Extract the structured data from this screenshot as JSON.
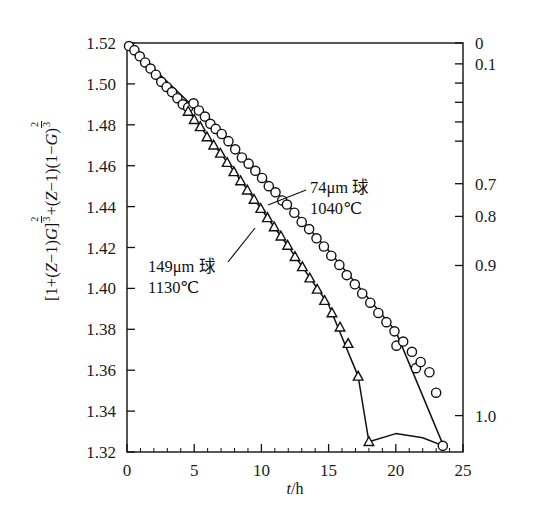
{
  "figure": {
    "background": "#ffffff",
    "ink": "#111111"
  },
  "axes": {
    "x": {
      "label_italic": "t",
      "label_rest": "/h",
      "label": "t/h",
      "min": 0,
      "max": 25,
      "ticks": [
        0,
        5,
        10,
        15,
        20,
        25
      ],
      "tick_labels": [
        "0",
        "5",
        "10",
        "15",
        "20",
        "25"
      ],
      "minor_step": 1
    },
    "y_left": {
      "label": "[1+(Z−1)G]^(2/3)+(Z−1)(1−G)^(2/3)",
      "label_parts": {
        "p1": "[1+(",
        "zi1": "Z",
        "p2": "−1)",
        "gi": "G",
        "p3": "]",
        "exp_num": "2",
        "exp_den": "3",
        "p4": "+(",
        "zi2": "Z",
        "p5": "−1)(1−",
        "gi2": "G",
        "p6": ")",
        "exp2_num": "2",
        "exp2_den": "3"
      },
      "min": 1.32,
      "max": 1.52,
      "ticks": [
        1.52,
        1.5,
        1.48,
        1.46,
        1.44,
        1.42,
        1.4,
        1.38,
        1.36,
        1.34,
        1.32
      ],
      "tick_labels": [
        "1.52",
        "1.50",
        "1.48",
        "1.46",
        "1.44",
        "1.42",
        "1.40",
        "1.38",
        "1.36",
        "1.34",
        "1.32"
      ]
    },
    "y_right": {
      "label": "",
      "tick_labels": [
        "0",
        "0.1",
        "",
        "",
        "",
        "",
        "0.7",
        "0.8",
        "0.9",
        "1.0"
      ],
      "labeled_ticks": [
        {
          "text": "0",
          "y_frac": 0.0
        },
        {
          "text": "0.1",
          "y_frac": 0.051
        },
        {
          "text": "",
          "y_frac": 0.098
        },
        {
          "text": "",
          "y_frac": 0.145
        },
        {
          "text": "",
          "y_frac": 0.193
        },
        {
          "text": "",
          "y_frac": 0.24
        },
        {
          "text": "0.7",
          "y_frac": 0.344
        },
        {
          "text": "0.8",
          "y_frac": 0.424
        },
        {
          "text": "0.9",
          "y_frac": 0.544
        },
        {
          "text": "1.0",
          "y_frac": 0.911
        }
      ]
    }
  },
  "annotations": [
    {
      "name": "series-74um-label",
      "line1": "74μm 球",
      "line2": "1040℃",
      "x": 310,
      "y": 188
    },
    {
      "name": "series-149um-label",
      "line1": "149μm 球",
      "line2": "1130℃",
      "x": 148,
      "y": 268
    }
  ],
  "chart_data": {
    "type": "scatter",
    "title": "",
    "xlabel": "t/h",
    "ylabel": "[1+(Z−1)G]^(2/3)+(Z−1)(1−G)^(2/3)",
    "xlim": [
      0,
      25
    ],
    "ylim": [
      1.32,
      1.52
    ],
    "grid": false,
    "legend": "inline annotations",
    "series": [
      {
        "name": "74μm 球 1040℃",
        "marker": "open-circle",
        "has_fit_line": true,
        "points": [
          {
            "x": 0.15,
            "y": 1.5185
          },
          {
            "x": 0.55,
            "y": 1.5165
          },
          {
            "x": 0.95,
            "y": 1.5135
          },
          {
            "x": 1.35,
            "y": 1.5105
          },
          {
            "x": 1.75,
            "y": 1.5075
          },
          {
            "x": 2.15,
            "y": 1.5045
          },
          {
            "x": 2.55,
            "y": 1.501
          },
          {
            "x": 2.95,
            "y": 1.4985
          },
          {
            "x": 3.35,
            "y": 1.496
          },
          {
            "x": 3.75,
            "y": 1.493
          },
          {
            "x": 4.15,
            "y": 1.49
          },
          {
            "x": 4.55,
            "y": 1.4885
          },
          {
            "x": 4.95,
            "y": 1.4905
          },
          {
            "x": 5.35,
            "y": 1.487
          },
          {
            "x": 5.8,
            "y": 1.484
          },
          {
            "x": 6.2,
            "y": 1.4805
          },
          {
            "x": 6.6,
            "y": 1.478
          },
          {
            "x": 7.05,
            "y": 1.4755
          },
          {
            "x": 7.55,
            "y": 1.472
          },
          {
            "x": 8.05,
            "y": 1.468
          },
          {
            "x": 8.55,
            "y": 1.464
          },
          {
            "x": 9.05,
            "y": 1.461
          },
          {
            "x": 9.55,
            "y": 1.4575
          },
          {
            "x": 10.05,
            "y": 1.454
          },
          {
            "x": 10.55,
            "y": 1.45
          },
          {
            "x": 11.05,
            "y": 1.447
          },
          {
            "x": 11.55,
            "y": 1.443
          },
          {
            "x": 11.9,
            "y": 1.441
          },
          {
            "x": 12.45,
            "y": 1.437
          },
          {
            "x": 13.0,
            "y": 1.4325
          },
          {
            "x": 13.55,
            "y": 1.429
          },
          {
            "x": 14.1,
            "y": 1.4245
          },
          {
            "x": 14.65,
            "y": 1.4205
          },
          {
            "x": 15.2,
            "y": 1.416
          },
          {
            "x": 15.8,
            "y": 1.4115
          },
          {
            "x": 16.35,
            "y": 1.4065
          },
          {
            "x": 16.95,
            "y": 1.402
          },
          {
            "x": 17.5,
            "y": 1.3975
          },
          {
            "x": 18.1,
            "y": 1.393
          },
          {
            "x": 18.7,
            "y": 1.388
          },
          {
            "x": 19.3,
            "y": 1.3835
          },
          {
            "x": 19.9,
            "y": 1.379
          },
          {
            "x": 20.05,
            "y": 1.372
          },
          {
            "x": 20.55,
            "y": 1.374
          },
          {
            "x": 21.2,
            "y": 1.369
          },
          {
            "x": 21.5,
            "y": 1.361
          },
          {
            "x": 21.85,
            "y": 1.364
          },
          {
            "x": 22.5,
            "y": 1.359
          },
          {
            "x": 23.0,
            "y": 1.349
          },
          {
            "x": 23.5,
            "y": 1.323
          }
        ],
        "fit_line": [
          {
            "x": 0.15,
            "y": 1.519
          },
          {
            "x": 5.0,
            "y": 1.4885
          },
          {
            "x": 10.0,
            "y": 1.4555
          },
          {
            "x": 15.0,
            "y": 1.4185
          },
          {
            "x": 20.0,
            "y": 1.379
          },
          {
            "x": 23.55,
            "y": 1.323
          }
        ]
      },
      {
        "name": "149μm 球 1130℃",
        "marker": "open-triangle",
        "has_fit_line": true,
        "points": [
          {
            "x": 4.55,
            "y": 1.4865
          },
          {
            "x": 5.0,
            "y": 1.4825
          },
          {
            "x": 5.45,
            "y": 1.479
          },
          {
            "x": 5.95,
            "y": 1.474
          },
          {
            "x": 6.45,
            "y": 1.47
          },
          {
            "x": 6.95,
            "y": 1.466
          },
          {
            "x": 7.45,
            "y": 1.4615
          },
          {
            "x": 7.95,
            "y": 1.457
          },
          {
            "x": 8.45,
            "y": 1.4525
          },
          {
            "x": 8.95,
            "y": 1.448
          },
          {
            "x": 9.45,
            "y": 1.4435
          },
          {
            "x": 9.95,
            "y": 1.439
          },
          {
            "x": 10.45,
            "y": 1.4345
          },
          {
            "x": 10.95,
            "y": 1.43
          },
          {
            "x": 11.45,
            "y": 1.4255
          },
          {
            "x": 11.95,
            "y": 1.421
          },
          {
            "x": 12.5,
            "y": 1.4155
          },
          {
            "x": 13.05,
            "y": 1.4105
          },
          {
            "x": 13.6,
            "y": 1.405
          },
          {
            "x": 14.15,
            "y": 1.3995
          },
          {
            "x": 14.7,
            "y": 1.394
          },
          {
            "x": 15.25,
            "y": 1.388
          },
          {
            "x": 15.85,
            "y": 1.381
          },
          {
            "x": 16.45,
            "y": 1.373
          },
          {
            "x": 17.2,
            "y": 1.357
          },
          {
            "x": 18.0,
            "y": 1.325
          }
        ],
        "fit_line": [
          {
            "x": 4.55,
            "y": 1.487
          },
          {
            "x": 8.0,
            "y": 1.457
          },
          {
            "x": 12.0,
            "y": 1.4205
          },
          {
            "x": 15.0,
            "y": 1.392
          },
          {
            "x": 17.2,
            "y": 1.357
          },
          {
            "x": 18.0,
            "y": 1.325
          }
        ],
        "tail_line": [
          {
            "x": 18.0,
            "y": 1.325
          },
          {
            "x": 20.0,
            "y": 1.329
          },
          {
            "x": 22.0,
            "y": 1.327
          },
          {
            "x": 23.55,
            "y": 1.323
          }
        ]
      }
    ]
  }
}
